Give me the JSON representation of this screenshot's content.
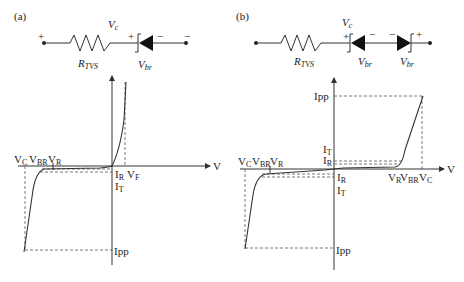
{
  "panel_a": {
    "label": "(a)",
    "circuit": {
      "plus_left": "+",
      "minus_right": "−",
      "vc": "V",
      "vc_sub": "c",
      "resistor": "R",
      "resistor_sub": "TVS",
      "diode_plus": "+",
      "diode_minus": "−",
      "vbr": "V",
      "vbr_sub": "br"
    },
    "graph": {
      "axis_v": "V",
      "vc": "V",
      "vc_sub": "C",
      "vbr": "V",
      "vbr_sub": "BR",
      "vr": "V",
      "vr_sub": "R",
      "ir": "I",
      "ir_sub": "R",
      "vf": "V",
      "vf_sub": "F",
      "it": "I",
      "it_sub": "T",
      "ipp": "Ipp"
    }
  },
  "panel_b": {
    "label": "(b)",
    "circuit": {
      "vc": "V",
      "vc_sub": "c",
      "resistor": "R",
      "resistor_sub": "TVS",
      "d1_plus": "+",
      "d1_minus": "−",
      "d2_minus": "−",
      "d2_plus": "+",
      "vbr1": "V",
      "vbr1_sub": "br",
      "vbr2": "V",
      "vbr2_sub": "br"
    },
    "graph": {
      "axis_v": "V",
      "ipp_top": "Ipp",
      "it_pos": "I",
      "it_pos_sub": "T",
      "ir_pos": "I",
      "ir_pos_sub": "R",
      "vc_neg": "V",
      "vc_neg_sub": "C",
      "vbr_neg": "V",
      "vbr_neg_sub": "BR",
      "vr_neg": "V",
      "vr_neg_sub": "R",
      "ir_neg": "I",
      "ir_neg_sub": "R",
      "it_neg": "I",
      "it_neg_sub": "T",
      "vr_pos": "V",
      "vr_pos_sub": "R",
      "vbr_pos": "V",
      "vbr_pos_sub": "BR",
      "vc_pos": "V",
      "vc_pos_sub": "C",
      "ipp_bottom": "Ipp"
    }
  }
}
